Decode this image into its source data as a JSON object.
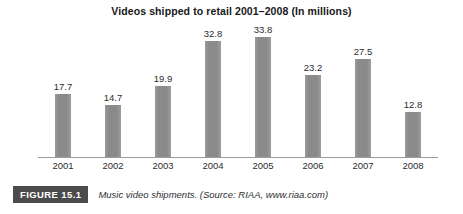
{
  "chart_data": {
    "type": "bar",
    "title": "Videos shipped to retail 2001–2008 (In millions)",
    "xlabel": "",
    "ylabel": "",
    "ylim": [
      0,
      33.8
    ],
    "grid": false,
    "legend": null,
    "bar_color": "#8e8e8e",
    "axis_color": "#9c9c9c",
    "categories": [
      "2001",
      "2002",
      "2003",
      "2004",
      "2005",
      "2006",
      "2007",
      "2008"
    ],
    "values": [
      17.7,
      14.7,
      19.9,
      32.8,
      33.8,
      23.2,
      27.5,
      12.8
    ],
    "value_labels": [
      "17.7",
      "14.7",
      "19.9",
      "32.8",
      "33.8",
      "23.2",
      "27.5",
      "12.8"
    ]
  },
  "caption": {
    "figure_badge": "FIGURE 15.1",
    "text": "Music video shipments. (Source: RIAA, www.riaa.com)"
  }
}
